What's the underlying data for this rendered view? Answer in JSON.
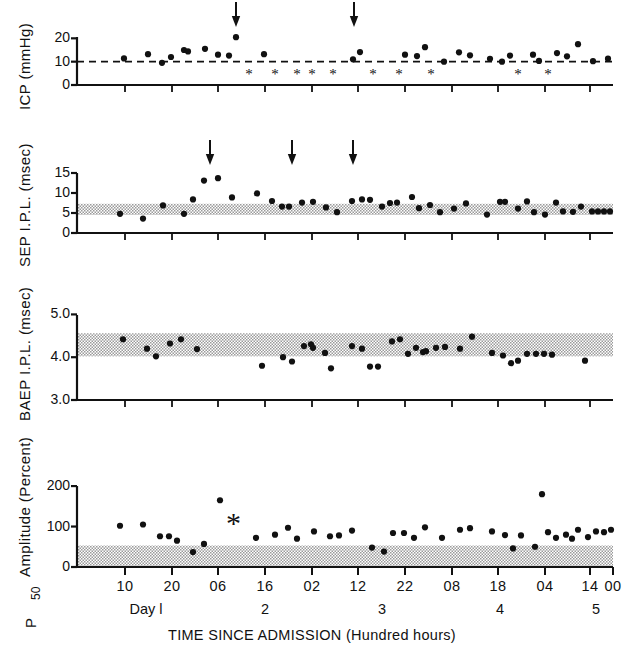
{
  "figure": {
    "width": 624,
    "height": 653,
    "background": "#ffffff",
    "ink": "#111111",
    "band_color": "#b9b9b9",
    "xtitle": "TIME SINCE ADMISSION (Hundred hours)",
    "day_label_prefix": "Day",
    "day_labels": [
      "Day l",
      "2",
      "3",
      "4",
      "5"
    ],
    "day_label_x": [
      146,
      265,
      382,
      500,
      596
    ],
    "x_axis": {
      "pixel_left": 77,
      "pixel_right": 613,
      "tick_labels": [
        "10",
        "20",
        "06",
        "16",
        "02",
        "12",
        "22",
        "08",
        "18",
        "04",
        "14",
        "00"
      ],
      "tick_pixels": [
        125,
        172,
        218,
        265,
        312,
        358,
        405,
        452,
        498,
        545,
        590,
        613
      ]
    }
  },
  "chart_data": [
    {
      "type": "scatter",
      "panel": "icp",
      "title": "",
      "ylabel": "ICP (mmHg)",
      "xlabel": "TIME SINCE ADMISSION (Hundred hours)",
      "ylim": [
        0,
        24
      ],
      "yticks": [
        0,
        10,
        20
      ],
      "ytick_labels": [
        "0",
        "10",
        "20"
      ],
      "grid": false,
      "reference_line": {
        "y": 10,
        "style": "dashed",
        "label": ""
      },
      "annotations": [
        {
          "type": "arrow",
          "x_pixel": 236,
          "label": ""
        },
        {
          "type": "arrow",
          "x_pixel": 354,
          "label": ""
        }
      ],
      "asterisk_marker_y": 4.8,
      "asterisk_x_pixels": [
        249,
        275,
        297,
        312,
        333,
        373,
        399,
        431,
        518,
        548
      ],
      "points": [
        {
          "x_pixel": 124,
          "y": 11.4
        },
        {
          "x_pixel": 148,
          "y": 13.2
        },
        {
          "x_pixel": 162,
          "y": 9.5
        },
        {
          "x_pixel": 171,
          "y": 12.0
        },
        {
          "x_pixel": 184,
          "y": 15.0
        },
        {
          "x_pixel": 188,
          "y": 14.4
        },
        {
          "x_pixel": 205,
          "y": 15.5
        },
        {
          "x_pixel": 218,
          "y": 13.0
        },
        {
          "x_pixel": 229,
          "y": 12.6
        },
        {
          "x_pixel": 236,
          "y": 20.5
        },
        {
          "x_pixel": 264,
          "y": 13.2
        },
        {
          "x_pixel": 353,
          "y": 11.0
        },
        {
          "x_pixel": 360,
          "y": 14.1
        },
        {
          "x_pixel": 405,
          "y": 13.0
        },
        {
          "x_pixel": 417,
          "y": 12.4
        },
        {
          "x_pixel": 425,
          "y": 16.2
        },
        {
          "x_pixel": 444,
          "y": 10.0
        },
        {
          "x_pixel": 459,
          "y": 14.0
        },
        {
          "x_pixel": 470,
          "y": 12.7
        },
        {
          "x_pixel": 490,
          "y": 11.2
        },
        {
          "x_pixel": 502,
          "y": 10.0
        },
        {
          "x_pixel": 510,
          "y": 12.6
        },
        {
          "x_pixel": 533,
          "y": 13.0
        },
        {
          "x_pixel": 539,
          "y": 10.3
        },
        {
          "x_pixel": 557,
          "y": 13.7
        },
        {
          "x_pixel": 567,
          "y": 12.3
        },
        {
          "x_pixel": 578,
          "y": 17.5
        },
        {
          "x_pixel": 593,
          "y": 10.2
        },
        {
          "x_pixel": 608,
          "y": 11.3
        }
      ]
    },
    {
      "type": "scatter",
      "panel": "sep",
      "title": "",
      "ylabel": "SEP I.P.L. (msec)",
      "xlabel": "TIME SINCE ADMISSION (Hundred hours)",
      "ylim": [
        0,
        16.5
      ],
      "yticks": [
        0,
        5,
        10,
        15
      ],
      "ytick_labels": [
        "0",
        "5",
        "10",
        "15"
      ],
      "grid": false,
      "normal_band": {
        "low": 4.5,
        "high": 7.3
      },
      "annotations": [
        {
          "type": "arrow",
          "x_pixel": 210,
          "label": ""
        },
        {
          "type": "arrow",
          "x_pixel": 292,
          "label": ""
        },
        {
          "type": "arrow",
          "x_pixel": 353,
          "label": ""
        }
      ],
      "points": [
        {
          "x_pixel": 120,
          "y": 4.8
        },
        {
          "x_pixel": 143,
          "y": 3.6
        },
        {
          "x_pixel": 163,
          "y": 6.9
        },
        {
          "x_pixel": 184,
          "y": 4.8
        },
        {
          "x_pixel": 193,
          "y": 8.4
        },
        {
          "x_pixel": 204,
          "y": 13.1
        },
        {
          "x_pixel": 218,
          "y": 13.7
        },
        {
          "x_pixel": 232,
          "y": 8.9
        },
        {
          "x_pixel": 257,
          "y": 9.9
        },
        {
          "x_pixel": 272,
          "y": 8.0
        },
        {
          "x_pixel": 282,
          "y": 6.6
        },
        {
          "x_pixel": 289,
          "y": 6.6
        },
        {
          "x_pixel": 302,
          "y": 7.6
        },
        {
          "x_pixel": 313,
          "y": 7.8
        },
        {
          "x_pixel": 326,
          "y": 6.4
        },
        {
          "x_pixel": 337,
          "y": 5.2
        },
        {
          "x_pixel": 352,
          "y": 8.0
        },
        {
          "x_pixel": 362,
          "y": 8.4
        },
        {
          "x_pixel": 370,
          "y": 8.3
        },
        {
          "x_pixel": 382,
          "y": 6.6
        },
        {
          "x_pixel": 390,
          "y": 7.5
        },
        {
          "x_pixel": 397,
          "y": 7.6
        },
        {
          "x_pixel": 412,
          "y": 9.0
        },
        {
          "x_pixel": 419,
          "y": 6.2
        },
        {
          "x_pixel": 430,
          "y": 7.0
        },
        {
          "x_pixel": 440,
          "y": 5.2
        },
        {
          "x_pixel": 454,
          "y": 6.1
        },
        {
          "x_pixel": 466,
          "y": 7.4
        },
        {
          "x_pixel": 487,
          "y": 4.6
        },
        {
          "x_pixel": 500,
          "y": 7.8
        },
        {
          "x_pixel": 505,
          "y": 7.8
        },
        {
          "x_pixel": 518,
          "y": 6.1
        },
        {
          "x_pixel": 527,
          "y": 7.9
        },
        {
          "x_pixel": 534,
          "y": 5.2
        },
        {
          "x_pixel": 545,
          "y": 4.6
        },
        {
          "x_pixel": 556,
          "y": 7.6
        },
        {
          "x_pixel": 563,
          "y": 5.4
        },
        {
          "x_pixel": 573,
          "y": 5.3
        },
        {
          "x_pixel": 581,
          "y": 6.6
        },
        {
          "x_pixel": 592,
          "y": 5.4
        },
        {
          "x_pixel": 598,
          "y": 5.4
        },
        {
          "x_pixel": 604,
          "y": 5.4
        },
        {
          "x_pixel": 610,
          "y": 5.4
        }
      ]
    },
    {
      "type": "scatter",
      "panel": "baep",
      "title": "",
      "ylabel": "BAEP I.P.L. (msec)",
      "xlabel": "TIME SINCE ADMISSION (Hundred hours)",
      "ylim": [
        3.0,
        5.15
      ],
      "yticks": [
        3.0,
        4.0,
        5.0
      ],
      "ytick_labels": [
        "3.0",
        "4.0",
        "5.0"
      ],
      "grid": false,
      "normal_band": {
        "low": 4.02,
        "high": 4.56
      },
      "annotations": [],
      "points": [
        {
          "x_pixel": 123,
          "y": 4.42
        },
        {
          "x_pixel": 147,
          "y": 4.2
        },
        {
          "x_pixel": 156,
          "y": 4.02
        },
        {
          "x_pixel": 170,
          "y": 4.32
        },
        {
          "x_pixel": 181,
          "y": 4.42
        },
        {
          "x_pixel": 197,
          "y": 4.19
        },
        {
          "x_pixel": 262,
          "y": 3.8
        },
        {
          "x_pixel": 283,
          "y": 4.0
        },
        {
          "x_pixel": 292,
          "y": 3.9
        },
        {
          "x_pixel": 304,
          "y": 4.26
        },
        {
          "x_pixel": 311,
          "y": 4.3
        },
        {
          "x_pixel": 313,
          "y": 4.22
        },
        {
          "x_pixel": 325,
          "y": 4.1
        },
        {
          "x_pixel": 331,
          "y": 3.74
        },
        {
          "x_pixel": 352,
          "y": 4.26
        },
        {
          "x_pixel": 362,
          "y": 4.2
        },
        {
          "x_pixel": 370,
          "y": 3.78
        },
        {
          "x_pixel": 378,
          "y": 3.78
        },
        {
          "x_pixel": 392,
          "y": 4.37
        },
        {
          "x_pixel": 400,
          "y": 4.42
        },
        {
          "x_pixel": 408,
          "y": 4.08
        },
        {
          "x_pixel": 416,
          "y": 4.22
        },
        {
          "x_pixel": 423,
          "y": 4.12
        },
        {
          "x_pixel": 426,
          "y": 4.14
        },
        {
          "x_pixel": 436,
          "y": 4.22
        },
        {
          "x_pixel": 445,
          "y": 4.24
        },
        {
          "x_pixel": 460,
          "y": 4.2
        },
        {
          "x_pixel": 472,
          "y": 4.48
        },
        {
          "x_pixel": 492,
          "y": 4.1
        },
        {
          "x_pixel": 503,
          "y": 4.04
        },
        {
          "x_pixel": 511,
          "y": 3.86
        },
        {
          "x_pixel": 518,
          "y": 3.92
        },
        {
          "x_pixel": 527,
          "y": 4.08
        },
        {
          "x_pixel": 536,
          "y": 4.08
        },
        {
          "x_pixel": 544,
          "y": 4.08
        },
        {
          "x_pixel": 552,
          "y": 4.06
        },
        {
          "x_pixel": 585,
          "y": 3.92
        }
      ]
    },
    {
      "type": "scatter",
      "panel": "p50",
      "title": "",
      "ylabel": "P₅₀ Amplitude (Percent)",
      "ylabel_main": "Amplitude (Percent)",
      "ylabel_sub": "P",
      "ylabel_sub_index": "50",
      "xlabel": "TIME SINCE ADMISSION (Hundred hours)",
      "ylim": [
        0,
        215
      ],
      "yticks": [
        0,
        100,
        200
      ],
      "ytick_labels": [
        "0",
        "100",
        "200"
      ],
      "grid": false,
      "normal_band": {
        "low": 0,
        "high": 53
      },
      "annotations": [
        {
          "type": "asterisk",
          "x_pixel": 235,
          "y": 100,
          "label": "*"
        }
      ],
      "points": [
        {
          "x_pixel": 120,
          "y": 102
        },
        {
          "x_pixel": 143,
          "y": 105
        },
        {
          "x_pixel": 160,
          "y": 76
        },
        {
          "x_pixel": 169,
          "y": 76
        },
        {
          "x_pixel": 177,
          "y": 65
        },
        {
          "x_pixel": 193,
          "y": 37
        },
        {
          "x_pixel": 204,
          "y": 57
        },
        {
          "x_pixel": 220,
          "y": 165
        },
        {
          "x_pixel": 256,
          "y": 72
        },
        {
          "x_pixel": 275,
          "y": 80
        },
        {
          "x_pixel": 288,
          "y": 97
        },
        {
          "x_pixel": 297,
          "y": 70
        },
        {
          "x_pixel": 314,
          "y": 88
        },
        {
          "x_pixel": 330,
          "y": 76
        },
        {
          "x_pixel": 339,
          "y": 78
        },
        {
          "x_pixel": 352,
          "y": 90
        },
        {
          "x_pixel": 372,
          "y": 48
        },
        {
          "x_pixel": 384,
          "y": 38
        },
        {
          "x_pixel": 393,
          "y": 84
        },
        {
          "x_pixel": 404,
          "y": 84
        },
        {
          "x_pixel": 414,
          "y": 72
        },
        {
          "x_pixel": 425,
          "y": 98
        },
        {
          "x_pixel": 442,
          "y": 72
        },
        {
          "x_pixel": 460,
          "y": 92
        },
        {
          "x_pixel": 470,
          "y": 96
        },
        {
          "x_pixel": 492,
          "y": 88
        },
        {
          "x_pixel": 505,
          "y": 79
        },
        {
          "x_pixel": 513,
          "y": 46
        },
        {
          "x_pixel": 521,
          "y": 78
        },
        {
          "x_pixel": 535,
          "y": 50
        },
        {
          "x_pixel": 542,
          "y": 180
        },
        {
          "x_pixel": 548,
          "y": 86
        },
        {
          "x_pixel": 556,
          "y": 72
        },
        {
          "x_pixel": 566,
          "y": 80
        },
        {
          "x_pixel": 572,
          "y": 70
        },
        {
          "x_pixel": 578,
          "y": 92
        },
        {
          "x_pixel": 588,
          "y": 74
        },
        {
          "x_pixel": 596,
          "y": 88
        },
        {
          "x_pixel": 604,
          "y": 86
        },
        {
          "x_pixel": 611,
          "y": 92
        }
      ]
    }
  ]
}
